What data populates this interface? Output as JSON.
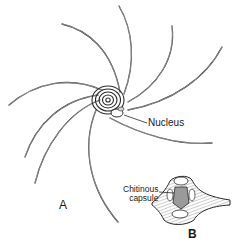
{
  "figure": {
    "panels": [
      {
        "id": "A",
        "label": "A",
        "description": "Spirally coiled organism with long curved arms radiating from a central body with concentric rings"
      },
      {
        "id": "B",
        "label": "B",
        "description": "Cross-section detail showing the chitinous capsule"
      }
    ],
    "labels": {
      "nucleus": "Nucleus",
      "capsule_line1": "Chitinous",
      "capsule_line2": "capsule",
      "panel_a": "A",
      "panel_b": "B"
    },
    "colors": {
      "ink": "#2a2a2a",
      "background": "#ffffff"
    }
  }
}
